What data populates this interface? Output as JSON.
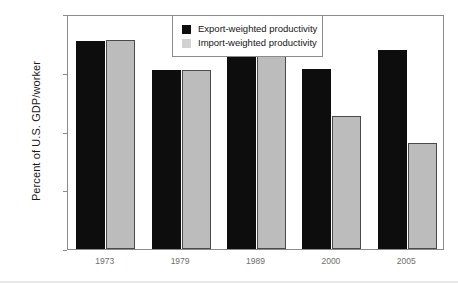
{
  "chart_data": {
    "type": "bar",
    "title": "",
    "xlabel": "",
    "ylabel": "Percent of U.S. GDP/worker",
    "categories": [
      "1973",
      "1979",
      "1989",
      "2000",
      "2005"
    ],
    "ylim": [
      40,
      60
    ],
    "ytick_labels": [
      "60%",
      "55%",
      "50%",
      "45%",
      "40%"
    ],
    "ytick_values": [
      60,
      55,
      50,
      45,
      40
    ],
    "grid": false,
    "legend_position": "top-center",
    "series": [
      {
        "name": "Export-weighted productivity",
        "color": "#0d0d0d",
        "values": [
          57.7,
          55.2,
          56.3,
          55.3,
          56.9
        ]
      },
      {
        "name": "Import-weighted productivity",
        "color": "#bcbcbc",
        "values": [
          57.8,
          55.2,
          56.5,
          51.3,
          49.0
        ]
      }
    ]
  },
  "axes": {
    "y_title": "Percent of U.S. GDP/worker"
  },
  "legend": {
    "items": [
      {
        "label": "Export-weighted productivity",
        "swatch": "black-square-icon"
      },
      {
        "label": "Import-weighted productivity",
        "swatch": "gray-square-icon"
      }
    ]
  },
  "colors": {
    "export_bar": "#0d0d0d",
    "import_bar": "#bcbcbc",
    "frame": "#8b8b8b",
    "tick_text": "#6e6e6e",
    "body_text": "#151515",
    "background": "#ffffff"
  }
}
